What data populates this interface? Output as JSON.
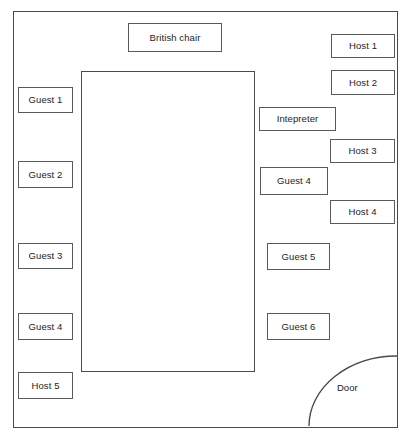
{
  "diagram": {
    "room": {
      "label": "room-outline"
    },
    "table": {
      "label": "conference-table"
    },
    "door": {
      "label": "Door",
      "swing": "quarter-arc"
    },
    "seats": [
      {
        "id": "british-chair",
        "label": "British chair",
        "x": 128,
        "y": 23,
        "w": 94,
        "h": 29
      },
      {
        "id": "host-1",
        "label": "Host 1",
        "x": 331,
        "y": 34,
        "w": 64,
        "h": 24
      },
      {
        "id": "host-2",
        "label": "Host 2",
        "x": 331,
        "y": 70,
        "w": 64,
        "h": 25
      },
      {
        "id": "guest-1",
        "label": "Guest 1",
        "x": 18,
        "y": 87,
        "w": 55,
        "h": 26
      },
      {
        "id": "interpreter",
        "label": "Intepreter",
        "x": 259,
        "y": 107,
        "w": 77,
        "h": 24
      },
      {
        "id": "host-3",
        "label": "Host 3",
        "x": 330,
        "y": 139,
        "w": 65,
        "h": 24
      },
      {
        "id": "guest-2",
        "label": "Guest 2",
        "x": 18,
        "y": 161,
        "w": 55,
        "h": 27
      },
      {
        "id": "guest-4-right",
        "label": "Guest 4",
        "x": 260,
        "y": 167,
        "w": 68,
        "h": 28
      },
      {
        "id": "host-4",
        "label": "Host 4",
        "x": 330,
        "y": 200,
        "w": 65,
        "h": 24
      },
      {
        "id": "guest-3",
        "label": "Guest 3",
        "x": 18,
        "y": 243,
        "w": 55,
        "h": 26
      },
      {
        "id": "guest-5",
        "label": "Guest 5",
        "x": 267,
        "y": 243,
        "w": 63,
        "h": 27
      },
      {
        "id": "guest-4-left",
        "label": "Guest 4",
        "x": 18,
        "y": 313,
        "w": 55,
        "h": 27
      },
      {
        "id": "guest-6",
        "label": "Guest 6",
        "x": 267,
        "y": 313,
        "w": 63,
        "h": 27
      },
      {
        "id": "host-5",
        "label": "Host 5",
        "x": 18,
        "y": 372,
        "w": 55,
        "h": 27
      }
    ]
  },
  "colors": {
    "stroke": "#4a4a4a",
    "seat_stroke": "#5a5a5a",
    "text": "#1d1d1d",
    "background": "#ffffff"
  }
}
